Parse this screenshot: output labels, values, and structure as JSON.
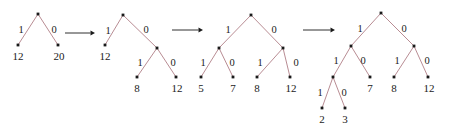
{
  "figure": {
    "caption": "",
    "edge_color": "#b07f87",
    "node_color": "#1a1a1a",
    "arrow_color": "#1a1a1a",
    "background": "#ffffff"
  },
  "trees": [
    {
      "name": "tree-1",
      "nodes": [
        {
          "id": "r",
          "x": 38,
          "y": 14,
          "type": "internal"
        },
        {
          "id": "l",
          "x": 18,
          "y": 45,
          "type": "leaf",
          "value": "12",
          "vx": 18,
          "vy": 56
        },
        {
          "id": "rr",
          "x": 58,
          "y": 45,
          "type": "leaf",
          "value": "20",
          "vx": 59,
          "vy": 56
        }
      ],
      "edges": [
        {
          "from": "r",
          "to": "l",
          "label": "1",
          "lx": 21,
          "ly": 30
        },
        {
          "from": "r",
          "to": "rr",
          "label": "0",
          "lx": 54,
          "ly": 30
        }
      ]
    },
    {
      "name": "tree-2",
      "nodes": [
        {
          "id": "r",
          "x": 123,
          "y": 15,
          "type": "internal"
        },
        {
          "id": "a",
          "x": 105,
          "y": 45,
          "type": "leaf",
          "value": "12",
          "vx": 105,
          "vy": 56
        },
        {
          "id": "b",
          "x": 157,
          "y": 48,
          "type": "internal"
        },
        {
          "id": "c",
          "x": 137,
          "y": 77,
          "type": "leaf",
          "value": "8",
          "vx": 137,
          "vy": 88
        },
        {
          "id": "d",
          "x": 176,
          "y": 77,
          "type": "leaf",
          "value": "12",
          "vx": 177,
          "vy": 88
        }
      ],
      "edges": [
        {
          "from": "r",
          "to": "a",
          "label": "1",
          "lx": 108,
          "ly": 31
        },
        {
          "from": "r",
          "to": "b",
          "label": "0",
          "lx": 146,
          "ly": 30
        },
        {
          "from": "b",
          "to": "c",
          "label": "1",
          "lx": 140,
          "ly": 63
        },
        {
          "from": "b",
          "to": "d",
          "label": "0",
          "lx": 173,
          "ly": 63
        }
      ]
    },
    {
      "name": "tree-3",
      "nodes": [
        {
          "id": "r",
          "x": 251,
          "y": 15,
          "type": "internal"
        },
        {
          "id": "a",
          "x": 219,
          "y": 48,
          "type": "internal"
        },
        {
          "id": "b",
          "x": 283,
          "y": 48,
          "type": "internal"
        },
        {
          "id": "c",
          "x": 201,
          "y": 77,
          "type": "leaf",
          "value": "5",
          "vx": 201,
          "vy": 88
        },
        {
          "id": "d",
          "x": 233,
          "y": 77,
          "type": "leaf",
          "value": "7",
          "vx": 233,
          "vy": 88
        },
        {
          "id": "e",
          "x": 257,
          "y": 77,
          "type": "leaf",
          "value": "8",
          "vx": 257,
          "vy": 88
        },
        {
          "id": "f",
          "x": 290,
          "y": 77,
          "type": "leaf",
          "value": "12",
          "vx": 291,
          "vy": 88
        }
      ],
      "edges": [
        {
          "from": "r",
          "to": "a",
          "label": "1",
          "lx": 228,
          "ly": 30
        },
        {
          "from": "r",
          "to": "b",
          "label": "0",
          "lx": 274,
          "ly": 30
        },
        {
          "from": "a",
          "to": "c",
          "label": "1",
          "lx": 203,
          "ly": 63
        },
        {
          "from": "a",
          "to": "d",
          "label": "0",
          "lx": 232,
          "ly": 63
        },
        {
          "from": "b",
          "to": "e",
          "label": "1",
          "lx": 260,
          "ly": 63
        },
        {
          "from": "b",
          "to": "f",
          "label": "0",
          "lx": 296,
          "ly": 63
        }
      ]
    },
    {
      "name": "tree-4",
      "nodes": [
        {
          "id": "r",
          "x": 381,
          "y": 13,
          "type": "internal"
        },
        {
          "id": "a",
          "x": 351,
          "y": 46,
          "type": "internal"
        },
        {
          "id": "b",
          "x": 414,
          "y": 46,
          "type": "internal"
        },
        {
          "id": "c",
          "x": 333,
          "y": 77,
          "type": "internal"
        },
        {
          "id": "d",
          "x": 370,
          "y": 77,
          "type": "leaf",
          "value": "7",
          "vx": 370,
          "vy": 88
        },
        {
          "id": "e",
          "x": 394,
          "y": 77,
          "type": "leaf",
          "value": "8",
          "vx": 394,
          "vy": 88
        },
        {
          "id": "f",
          "x": 428,
          "y": 77,
          "type": "leaf",
          "value": "12",
          "vx": 429,
          "vy": 88
        },
        {
          "id": "g",
          "x": 322,
          "y": 108,
          "type": "leaf",
          "value": "2",
          "vx": 322,
          "vy": 119
        },
        {
          "id": "h",
          "x": 345,
          "y": 108,
          "type": "leaf",
          "value": "3",
          "vx": 345,
          "vy": 119
        }
      ],
      "edges": [
        {
          "from": "r",
          "to": "a",
          "label": "1",
          "lx": 360,
          "ly": 29
        },
        {
          "from": "r",
          "to": "b",
          "label": "0",
          "lx": 404,
          "ly": 29
        },
        {
          "from": "a",
          "to": "c",
          "label": "1",
          "lx": 336,
          "ly": 61
        },
        {
          "from": "a",
          "to": "d",
          "label": "0",
          "lx": 363,
          "ly": 61
        },
        {
          "from": "b",
          "to": "e",
          "label": "1",
          "lx": 397,
          "ly": 61
        },
        {
          "from": "b",
          "to": "f",
          "label": "0",
          "lx": 427,
          "ly": 61
        },
        {
          "from": "c",
          "to": "g",
          "label": "1",
          "lx": 320,
          "ly": 93
        },
        {
          "from": "c",
          "to": "h",
          "label": "0",
          "lx": 344,
          "ly": 93
        }
      ]
    }
  ],
  "arrows": [
    {
      "name": "arrow-1",
      "x1": 65,
      "y1": 33,
      "x2": 95,
      "y2": 33
    },
    {
      "name": "arrow-2",
      "x1": 172,
      "y1": 30,
      "x2": 203,
      "y2": 30
    },
    {
      "name": "arrow-3",
      "x1": 303,
      "y1": 30,
      "x2": 335,
      "y2": 30
    }
  ]
}
